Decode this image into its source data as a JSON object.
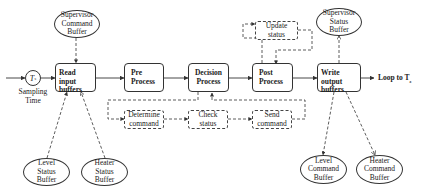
{
  "diagram": {
    "sampling": {
      "symbol": "T",
      "subscript": "s",
      "label_line1": "Sampling",
      "label_line2": "Time"
    },
    "main_blocks": [
      {
        "id": "read",
        "line1": "Read input",
        "line2": "buffers"
      },
      {
        "id": "pre",
        "line1": "Pre",
        "line2": "Process"
      },
      {
        "id": "decision",
        "line1": "Decision",
        "line2": "Process"
      },
      {
        "id": "post",
        "line1": "Post",
        "line2": "Process"
      },
      {
        "id": "write",
        "line1": "Write output",
        "line2": "buffers"
      }
    ],
    "loop_label": "Loop to T",
    "loop_subscript": "s",
    "sub_blocks": [
      {
        "id": "determine",
        "line1": "Determine",
        "line2": "command"
      },
      {
        "id": "check",
        "line1": "Check",
        "line2": "status"
      },
      {
        "id": "send",
        "line1": "Send",
        "line2": "command"
      },
      {
        "id": "update",
        "line1": "Update",
        "line2": "status"
      }
    ],
    "buffers": [
      {
        "id": "sup-cmd",
        "lines": [
          "Supervisor",
          "Command",
          "Buffer"
        ]
      },
      {
        "id": "level-status",
        "lines": [
          "Level",
          "Status",
          "Buffer"
        ]
      },
      {
        "id": "heater-status",
        "lines": [
          "Heater",
          "Status",
          "Buffer"
        ]
      },
      {
        "id": "sup-status",
        "lines": [
          "Supervisor",
          "Status",
          "Buffer"
        ]
      },
      {
        "id": "level-cmd",
        "lines": [
          "Level",
          "Command",
          "Buffer"
        ]
      },
      {
        "id": "heater-cmd",
        "lines": [
          "Heater",
          "Command",
          "Buffer"
        ]
      }
    ]
  }
}
